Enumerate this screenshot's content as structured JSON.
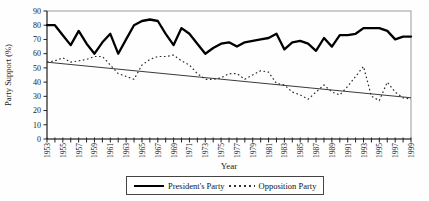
{
  "figure": {
    "ylabel": "Party Support (%)",
    "xlabel": "Year"
  },
  "legend": {
    "entries": [
      {
        "label": "President's Party",
        "style": "solid"
      },
      {
        "label": "Opposition Party",
        "style": "dotted"
      }
    ]
  },
  "colors": {
    "president_line": "#000000",
    "opposition_line": "#2a2a2a",
    "trend_line": "#3a3a3a",
    "plot_border": "#9a9a9a",
    "axis": "#222222",
    "text": "#1a1a1a",
    "background": "#fefefe"
  },
  "chart_data": {
    "type": "line",
    "title": "",
    "xlabel": "Year",
    "ylabel": "Party Support (%)",
    "ylim": [
      0,
      90
    ],
    "y_ticks": [
      0,
      10,
      20,
      30,
      40,
      50,
      60,
      70,
      80,
      90
    ],
    "x": [
      1953,
      1954,
      1955,
      1956,
      1957,
      1958,
      1959,
      1960,
      1961,
      1962,
      1963,
      1964,
      1965,
      1966,
      1967,
      1968,
      1969,
      1970,
      1971,
      1972,
      1973,
      1974,
      1975,
      1976,
      1977,
      1978,
      1979,
      1980,
      1981,
      1982,
      1983,
      1984,
      1985,
      1986,
      1987,
      1988,
      1989,
      1990,
      1991,
      1992,
      1993,
      1994,
      1995,
      1996,
      1997,
      1998,
      1999
    ],
    "x_tick_labels": [
      1953,
      1955,
      1957,
      1959,
      1961,
      1963,
      1965,
      1967,
      1969,
      1971,
      1973,
      1975,
      1977,
      1979,
      1981,
      1983,
      1985,
      1987,
      1989,
      1991,
      1993,
      1995,
      1997,
      1999
    ],
    "series": [
      {
        "name": "President's Party",
        "style": "solid",
        "values": [
          80,
          80,
          73,
          66,
          76,
          67,
          60,
          68,
          74,
          60,
          70,
          80,
          83,
          84,
          83,
          74,
          66,
          78,
          74,
          67,
          60,
          64,
          67,
          68,
          65,
          68,
          69,
          70,
          71,
          74,
          63,
          68,
          69,
          67,
          62,
          71,
          65,
          73,
          73,
          74,
          78,
          78,
          78,
          76,
          70,
          72,
          72
        ]
      },
      {
        "name": "Opposition Party",
        "style": "dotted",
        "values": [
          54,
          55,
          57,
          54,
          55,
          56,
          58,
          58,
          52,
          46,
          44,
          42,
          52,
          56,
          58,
          58,
          59,
          55,
          52,
          46,
          42,
          42,
          43,
          46,
          46,
          42,
          45,
          48,
          47,
          39,
          38,
          33,
          31,
          28,
          33,
          38,
          33,
          31,
          37,
          44,
          51,
          30,
          27,
          40,
          33,
          29,
          28
        ]
      }
    ],
    "trend_line": {
      "x1": 1953,
      "y1": 54,
      "x2": 1999,
      "y2": 29
    },
    "grid": "off",
    "legend_position": "bottom"
  }
}
